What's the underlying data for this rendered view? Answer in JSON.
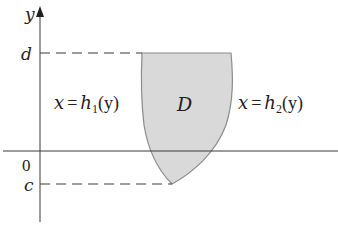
{
  "diagram": {
    "type": "region-between-curves",
    "axes": {
      "y_label": "y",
      "origin_label": "0"
    },
    "bounds": {
      "upper_label": "d",
      "lower_label": "c"
    },
    "region": {
      "label": "D",
      "fill_color": "#d9d9d9",
      "edge_color": "#8c8c8c"
    },
    "curves": {
      "left": {
        "lhs": "x",
        "eq": "=",
        "func": "h",
        "sub": "1",
        "arg": "(y)"
      },
      "right": {
        "lhs": "x",
        "eq": "=",
        "func": "h",
        "sub": "2",
        "arg": "(y)"
      }
    },
    "colors": {
      "axis": "#3a3a3a",
      "text": "#231f20"
    }
  }
}
